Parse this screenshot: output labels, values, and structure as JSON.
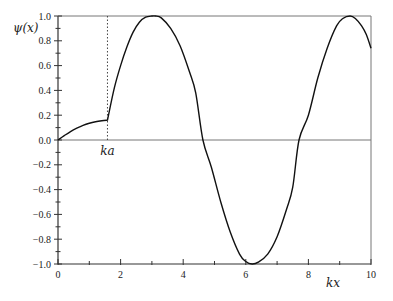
{
  "chart_data": {
    "type": "line",
    "title": "",
    "xlabel": "kx",
    "ylabel": "ψ(x)",
    "xlim": [
      0,
      10
    ],
    "ylim": [
      -1.0,
      1.0
    ],
    "x_ticks_major": [
      0,
      2,
      4,
      6,
      8,
      10
    ],
    "x_ticks_minor": [
      1,
      3,
      5,
      7,
      9
    ],
    "x_tick_labels": [
      "0",
      "2",
      "4",
      "6",
      "8",
      "10"
    ],
    "y_ticks_major": [
      -1.0,
      -0.8,
      -0.6,
      -0.4,
      -0.2,
      0.0,
      0.2,
      0.4,
      0.6,
      0.8,
      1.0
    ],
    "y_ticks_minor": [
      -0.9,
      -0.7,
      -0.5,
      -0.3,
      -0.1,
      0.1,
      0.3,
      0.5,
      0.7,
      0.9
    ],
    "y_tick_labels": [
      "−1.0",
      "−0.8",
      "−0.6",
      "−0.4",
      "−0.2",
      "0.0",
      "0.2",
      "0.4",
      "0.6",
      "0.8",
      "1.0"
    ],
    "grid": false,
    "zero_line": true,
    "annotations": [
      {
        "text": "ka",
        "x": 1.58,
        "type": "vertical-dotted-line"
      }
    ],
    "series": [
      {
        "name": "ψ(x)",
        "x": [
          0,
          0.2,
          0.4,
          0.6,
          0.8,
          1.0,
          1.2,
          1.4,
          1.58,
          1.8,
          2.0,
          2.2,
          2.4,
          2.6,
          2.8,
          3.0,
          3.12,
          3.3,
          3.6,
          3.9,
          4.2,
          4.4,
          4.63,
          4.9,
          5.2,
          5.5,
          5.8,
          6.0,
          6.2,
          6.4,
          6.7,
          7.0,
          7.3,
          7.5,
          7.7,
          8.0,
          8.3,
          8.6,
          8.9,
          9.1,
          9.33,
          9.5,
          9.7,
          9.85,
          10.0
        ],
        "y": [
          0.0,
          0.035,
          0.068,
          0.095,
          0.118,
          0.135,
          0.147,
          0.155,
          0.16,
          0.42,
          0.6,
          0.75,
          0.87,
          0.95,
          0.99,
          1.0,
          1.0,
          0.985,
          0.9,
          0.76,
          0.55,
          0.38,
          0.0,
          -0.22,
          -0.5,
          -0.74,
          -0.92,
          -0.98,
          -1.0,
          -0.985,
          -0.92,
          -0.78,
          -0.56,
          -0.38,
          0.0,
          0.2,
          0.5,
          0.74,
          0.92,
          0.98,
          1.0,
          0.98,
          0.92,
          0.85,
          0.74
        ]
      }
    ]
  }
}
